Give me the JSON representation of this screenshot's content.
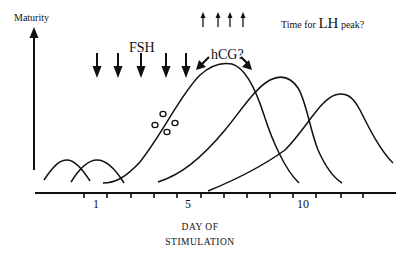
{
  "diagram": {
    "y_axis_label": "Maturity",
    "fsh_label": "FSH",
    "hcg_label": "hCG?",
    "lh_label": {
      "prefix": "Time for",
      "big": "LH",
      "suffix": "peak?"
    },
    "x_axis": {
      "title_line1": "DAY OF",
      "title_line2": "STIMULATION",
      "tick_labels": [
        {
          "label": "1",
          "x": 96
        },
        {
          "label": "5",
          "x": 188
        },
        {
          "label": "10",
          "x": 304
        }
      ]
    },
    "fsh_arrow_count": 5,
    "lh_arrow_count": 4,
    "colors": {
      "ink": "#111111",
      "background": "#ffffff"
    }
  }
}
